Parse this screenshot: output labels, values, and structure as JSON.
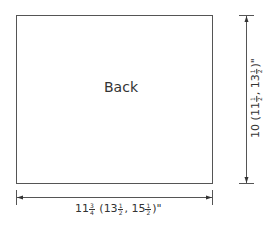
{
  "diagram": {
    "type": "schematic",
    "piece": {
      "label": "Back"
    },
    "dimensions": {
      "width": {
        "main": "11",
        "main_frac_num": "3",
        "main_frac_den": "4",
        "alt1": "13",
        "alt1_frac_num": "1",
        "alt1_frac_den": "2",
        "alt2": "15",
        "alt2_frac_num": "1",
        "alt2_frac_den": "2",
        "unit": "\"",
        "text": "11 3/4 (13 1/2, 15 1/2)\""
      },
      "height": {
        "main": "10",
        "alt1": "11",
        "alt1_frac_num": "1",
        "alt1_frac_den": "2",
        "alt2": "13",
        "alt2_frac_num": "1",
        "alt2_frac_den": "2",
        "unit": "\"",
        "text": "10 (11 1/2, 13 1/2)\""
      }
    },
    "colors": {
      "line": "#555555",
      "text": "#333333",
      "background": "#ffffff"
    }
  }
}
